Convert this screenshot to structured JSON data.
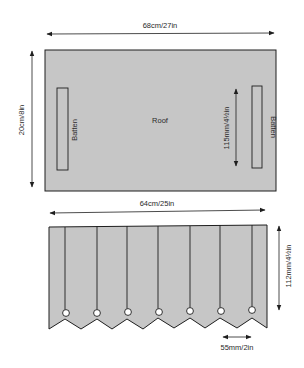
{
  "colors": {
    "panel_fill": "#c6c6c6",
    "stroke": "#1e1e1e",
    "background": "#ffffff"
  },
  "roof_panel": {
    "label": "Roof",
    "width_label": "68cm/27in",
    "height_label": "20cm/8in",
    "batten_left_label": "Batten",
    "batten_right_label": "Batten",
    "batten_spacing_label": "115mm/4½in"
  },
  "valance_panel": {
    "width_label": "64cm/25in",
    "height_label": "112mm/4½in",
    "point_spacing_label": "55mm/2in",
    "fold_lines": 7,
    "points": 7
  }
}
